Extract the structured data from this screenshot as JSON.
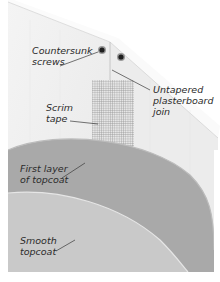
{
  "diagram": {
    "labels": {
      "countersunk_screws": {
        "line1": "Countersunk",
        "line2": "screws"
      },
      "untapered_join": {
        "line1": "Untapered",
        "line2": "plasterboard",
        "line3": "join"
      },
      "scrim_tape": {
        "line1": "Scrim",
        "line2": "tape"
      },
      "first_layer": {
        "line1": "First layer",
        "line2": "of topcoat"
      },
      "smooth_topcoat": {
        "line1": "Smooth",
        "line2": "topcoat"
      }
    },
    "colors": {
      "board": "#f1f1f1",
      "board_edge": "#fafafa",
      "board_shadow": "#d9d9d9",
      "first_layer": "#a9a9a9",
      "smooth_topcoat": "#c8c8c8",
      "scrim": "#8a8a8a",
      "screw": "#1e1e1e",
      "leader": "#3a3a3a"
    }
  }
}
